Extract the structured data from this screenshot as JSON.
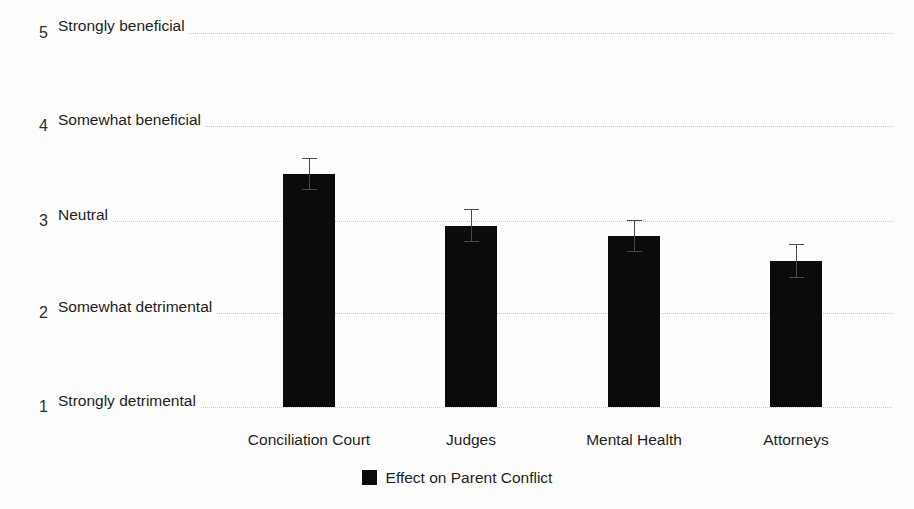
{
  "chart_data": {
    "type": "bar",
    "title": "",
    "subtitle": "",
    "xlabel": "",
    "ylabel": "",
    "categories": [
      "Conciliation Court",
      "Judges",
      "Mental Health",
      "Attorneys"
    ],
    "series": [
      {
        "name": "Effect on Parent Conflict",
        "values": [
          3.49,
          2.94,
          2.83,
          2.56
        ],
        "errors": [
          0.17,
          0.18,
          0.17,
          0.18
        ],
        "color": "#0b0b0b"
      }
    ],
    "ylim": [
      1,
      5
    ],
    "yticks": [
      1,
      2,
      3,
      4,
      5
    ],
    "ytick_labels": [
      "Strongly detrimental",
      "Somewhat detrimental",
      "Neutral",
      "Somewhat beneficial",
      "Strongly beneficial"
    ],
    "grid": true,
    "grid_axis": "y",
    "grid_style": "dotted",
    "legend": {
      "position": "bottom-center",
      "entries": [
        {
          "label": "Effect on Parent Conflict",
          "color": "#0b0b0b"
        }
      ]
    },
    "error_bars": true,
    "error_bar_color": "#4a4a4a",
    "background_color": "#fdfdfd"
  },
  "axis": {
    "y": [
      {
        "number": "5",
        "word": "Strongly beneficial",
        "value": 5
      },
      {
        "number": "4",
        "word": "Somewhat beneficial",
        "value": 4
      },
      {
        "number": "3",
        "word": "Neutral",
        "value": 3
      },
      {
        "number": "2",
        "word": "Somewhat detrimental",
        "value": 2
      },
      {
        "number": "1",
        "word": "Strongly detrimental",
        "value": 1
      }
    ]
  }
}
